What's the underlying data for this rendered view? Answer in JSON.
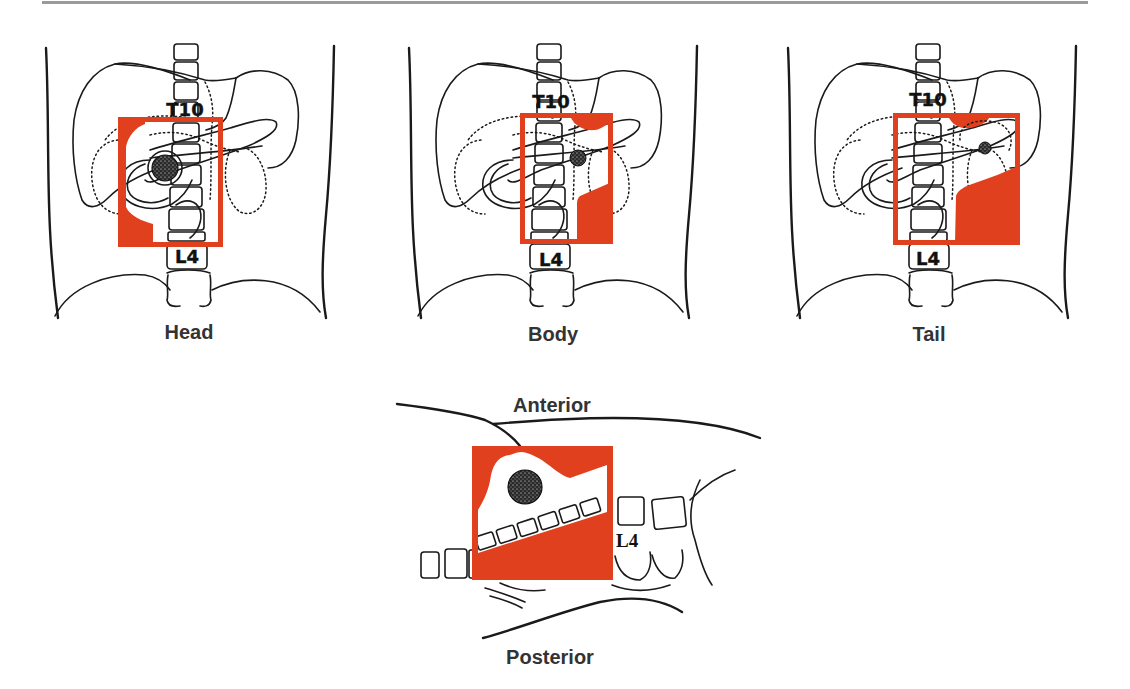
{
  "colors": {
    "radiation_field": "#e0401e",
    "line_art": "#1a1a1a",
    "label_text": "#333333",
    "header_rule": "#9a9a9a",
    "tumor": "#2a2a2a"
  },
  "panels": [
    {
      "label": "Head",
      "upper_landmark": "T10",
      "lower_landmark": "L4"
    },
    {
      "label": "Body",
      "upper_landmark": "T10",
      "lower_landmark": "L4"
    },
    {
      "label": "Tail",
      "upper_landmark": "T10",
      "lower_landmark": "L4"
    }
  ],
  "lateral": {
    "top_label": "Anterior",
    "bottom_label": "Posterior",
    "landmark": "L4"
  }
}
